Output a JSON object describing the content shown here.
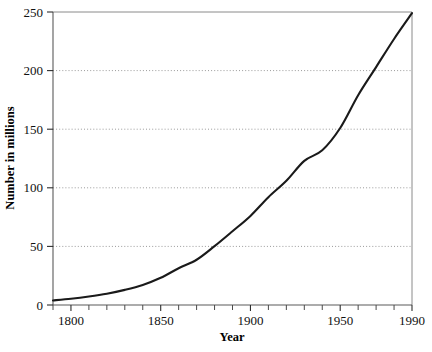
{
  "chart_data": {
    "type": "line",
    "title": "",
    "subtitle": "",
    "xlabel": "Year",
    "ylabel": "Number in millions",
    "xlim": [
      1790,
      1990
    ],
    "ylim": [
      0,
      250
    ],
    "grid": true,
    "grid_axis": "y",
    "legend": false,
    "legend_position": "none",
    "x_tick_labels": [
      "1800",
      "1850",
      "1900",
      "1950",
      "1990"
    ],
    "x_tick_values": [
      1800,
      1850,
      1900,
      1950,
      1990
    ],
    "x_minor_tick_step": 10,
    "y_tick_labels": [
      "0",
      "50",
      "100",
      "150",
      "200",
      "250"
    ],
    "y_tick_values": [
      0,
      50,
      100,
      150,
      200,
      250
    ],
    "series": [
      {
        "name": "Number in millions",
        "color": "#1a1a1a",
        "x": [
          1790,
          1800,
          1810,
          1820,
          1830,
          1840,
          1850,
          1860,
          1870,
          1880,
          1890,
          1900,
          1910,
          1920,
          1930,
          1940,
          1950,
          1960,
          1970,
          1980,
          1990
        ],
        "values": [
          3.9,
          5.3,
          7.2,
          9.6,
          12.9,
          17.1,
          23.2,
          31.4,
          38.6,
          50.2,
          62.9,
          76.0,
          92.0,
          106.0,
          123.0,
          132.0,
          151.0,
          179.0,
          203.0,
          227.0,
          249.0
        ]
      }
    ],
    "annotations": []
  },
  "axis": {
    "x_title": "Year",
    "y_title": "Number in millions"
  },
  "ticks": {
    "x": [
      {
        "label": "1800",
        "value": 1800
      },
      {
        "label": "1850",
        "value": 1850
      },
      {
        "label": "1900",
        "value": 1900
      },
      {
        "label": "1950",
        "value": 1950
      },
      {
        "label": "1990",
        "value": 1990
      }
    ],
    "y": [
      {
        "label": "0",
        "value": 0
      },
      {
        "label": "50",
        "value": 50
      },
      {
        "label": "100",
        "value": 100
      },
      {
        "label": "150",
        "value": 150
      },
      {
        "label": "200",
        "value": 200
      },
      {
        "label": "250",
        "value": 250
      }
    ]
  },
  "colors": {
    "curve": "#1a1a1a",
    "grid": "#9a9a9a",
    "axis": "#5a5a5a",
    "background": "#ffffff"
  }
}
